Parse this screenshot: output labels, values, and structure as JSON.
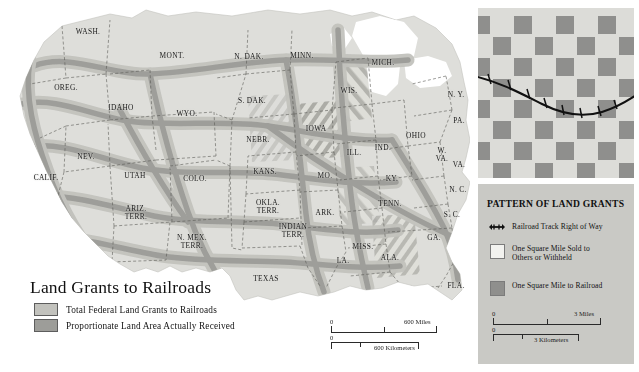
{
  "map": {
    "title": "Land Grants to Railroads",
    "legend": [
      {
        "label": "Total Federal Land Grants to Railroads",
        "color": "#c2c2bd",
        "swatch_name": "total-federal-grants-swatch"
      },
      {
        "label": "Proportionate Land Area Actually Received",
        "color": "#9d9d99",
        "swatch_name": "proportionate-area-swatch"
      }
    ],
    "states": [
      {
        "id": "wash",
        "label": "WASH.",
        "x": 88,
        "y": 32,
        "size": ""
      },
      {
        "id": "oreg",
        "label": "OREG.",
        "x": 66,
        "y": 88,
        "size": ""
      },
      {
        "id": "calif",
        "label": "CALIF.",
        "x": 46,
        "y": 178,
        "size": ""
      },
      {
        "id": "nev",
        "label": "NEV.",
        "x": 86,
        "y": 157,
        "size": ""
      },
      {
        "id": "idaho",
        "label": "IDAHO",
        "x": 121,
        "y": 108,
        "size": ""
      },
      {
        "id": "mont",
        "label": "MONT.",
        "x": 172,
        "y": 56,
        "size": ""
      },
      {
        "id": "wyo",
        "label": "WYO.",
        "x": 187,
        "y": 114,
        "size": ""
      },
      {
        "id": "utah",
        "label": "UTAH",
        "x": 135,
        "y": 176,
        "size": ""
      },
      {
        "id": "colo",
        "label": "COLO.",
        "x": 195,
        "y": 179,
        "size": ""
      },
      {
        "id": "ariz-terr",
        "label": "ARIZ.\nTERR.",
        "x": 136,
        "y": 213,
        "size": ""
      },
      {
        "id": "nmex-terr",
        "label": "N. MEX.\nTERR.",
        "x": 192,
        "y": 242,
        "size": ""
      },
      {
        "id": "ndak",
        "label": "N. DAK.",
        "x": 249,
        "y": 57,
        "size": ""
      },
      {
        "id": "sdak",
        "label": "S. DAK.",
        "x": 252,
        "y": 101,
        "size": ""
      },
      {
        "id": "nebr",
        "label": "NEBR.",
        "x": 258,
        "y": 140,
        "size": ""
      },
      {
        "id": "kans",
        "label": "KANS.",
        "x": 265,
        "y": 172,
        "size": ""
      },
      {
        "id": "okla-terr",
        "label": "OKLA.\nTERR.",
        "x": 268,
        "y": 207,
        "size": ""
      },
      {
        "id": "indian-terr",
        "label": "INDIAN\nTERR.",
        "x": 293,
        "y": 231,
        "size": ""
      },
      {
        "id": "texas",
        "label": "TEXAS",
        "x": 266,
        "y": 279,
        "size": ""
      },
      {
        "id": "minn",
        "label": "MINN.",
        "x": 302,
        "y": 56,
        "size": ""
      },
      {
        "id": "iowa",
        "label": "IOWA",
        "x": 316,
        "y": 129,
        "size": ""
      },
      {
        "id": "mo",
        "label": "MO.",
        "x": 325,
        "y": 176,
        "size": ""
      },
      {
        "id": "ark",
        "label": "ARK.",
        "x": 325,
        "y": 213,
        "size": ""
      },
      {
        "id": "la",
        "label": "LA.",
        "x": 343,
        "y": 261,
        "size": ""
      },
      {
        "id": "miss",
        "label": "MISS.",
        "x": 363,
        "y": 247,
        "size": ""
      },
      {
        "id": "ala",
        "label": "ALA.",
        "x": 390,
        "y": 258,
        "size": ""
      },
      {
        "id": "wis",
        "label": "WIS.",
        "x": 349,
        "y": 91,
        "size": ""
      },
      {
        "id": "ill",
        "label": "ILL.",
        "x": 354,
        "y": 153,
        "size": ""
      },
      {
        "id": "mich",
        "label": "MICH.",
        "x": 383,
        "y": 63,
        "size": ""
      },
      {
        "id": "ind",
        "label": "IND.",
        "x": 383,
        "y": 148,
        "size": ""
      },
      {
        "id": "ohio",
        "label": "OHIO",
        "x": 416,
        "y": 136,
        "size": ""
      },
      {
        "id": "ky",
        "label": "KY.",
        "x": 392,
        "y": 179,
        "size": ""
      },
      {
        "id": "tenn",
        "label": "TENN.",
        "x": 390,
        "y": 204,
        "size": ""
      },
      {
        "id": "ga",
        "label": "GA.",
        "x": 434,
        "y": 238,
        "size": ""
      },
      {
        "id": "fla",
        "label": "FLA.",
        "x": 456,
        "y": 286,
        "size": ""
      },
      {
        "id": "sc",
        "label": "S. C.",
        "x": 452,
        "y": 215,
        "size": ""
      },
      {
        "id": "nc",
        "label": "N. C.",
        "x": 458,
        "y": 190,
        "size": ""
      },
      {
        "id": "va",
        "label": "VA.",
        "x": 459,
        "y": 165,
        "size": ""
      },
      {
        "id": "wva",
        "label": "W.\nVA.",
        "x": 442,
        "y": 155,
        "size": ""
      },
      {
        "id": "pa",
        "label": "PA.",
        "x": 459,
        "y": 121,
        "size": ""
      },
      {
        "id": "ny",
        "label": "N. Y.",
        "x": 456,
        "y": 95,
        "size": ""
      }
    ],
    "scale_miles": {
      "zero": "0",
      "value": "600 Miles"
    },
    "scale_km": {
      "zero": "0",
      "value": "600 Kilometers"
    }
  },
  "panel": {
    "title": "PATTERN OF LAND GRANTS",
    "items": [
      {
        "key": "railroad-track-icon",
        "label": "Railroad Track Right of Way",
        "color": "#111111"
      },
      {
        "key": "sold-square",
        "label": "One Square Mile Sold to\nOthers or Withheld",
        "color": "#f2f2ef"
      },
      {
        "key": "railroad-square",
        "label": "One Square Mile to Railroad",
        "color": "#8f8f8d"
      }
    ],
    "scale_miles": {
      "zero": "0",
      "value": "3 Miles"
    },
    "scale_km": {
      "zero": "0",
      "value": "3 Kilometers"
    },
    "colors": {
      "checker_light": "#dcdcd8",
      "checker_dark": "#8f8f8d",
      "panel_bg": "#c9c9c5"
    }
  }
}
